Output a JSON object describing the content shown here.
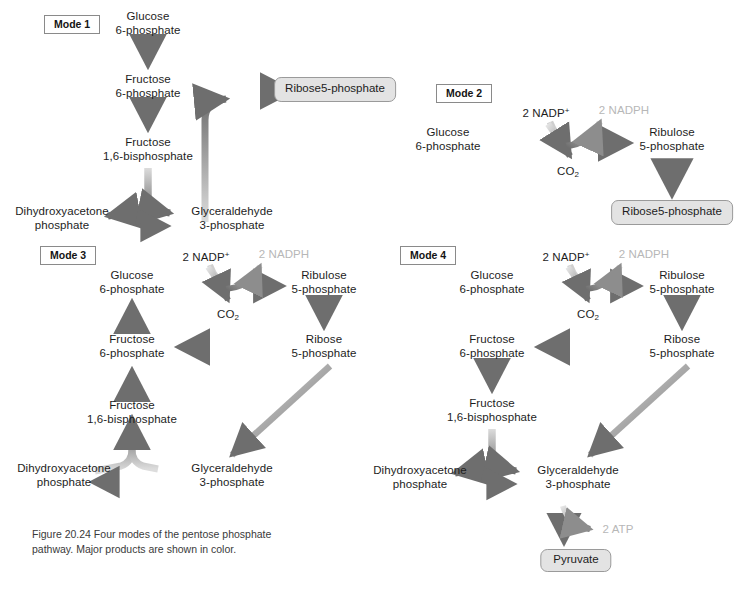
{
  "figure": {
    "caption_line1": "Figure 20.24  Four modes of the pentose",
    "caption_line2": "phosphate pathway.  Major products are",
    "caption_line3": "shown in color."
  },
  "colors": {
    "arrow_dark": "#6e6e6e",
    "arrow_light": "#d8d8d8",
    "product_box_fill": "#e3e3e3",
    "product_box_border": "#9a9a9a",
    "mode_box_border": "#8a8a8a",
    "faint_text": "#b7b7b7",
    "text": "#1d1d1d",
    "background": "#ffffff"
  },
  "modes": [
    {
      "id": "mode1",
      "label": "Mode 1",
      "nodes": [
        {
          "name": "glucose-6-phosphate",
          "line1": "Glucose",
          "line2": "6-phosphate"
        },
        {
          "name": "fructose-6-phosphate",
          "line1": "Fructose",
          "line2": "6-phosphate"
        },
        {
          "name": "fructose-1-6-bisphosphate",
          "line1": "Fructose",
          "line2": "1,6-bisphosphate"
        },
        {
          "name": "dihydroxyacetone-phosphate",
          "line1": "Dihydroxyacetone",
          "line2": "phosphate"
        },
        {
          "name": "glyceraldehyde-3-phosphate",
          "line1": "Glyceraldehyde",
          "line2": "3-phosphate"
        }
      ],
      "product": {
        "name": "ribose-5-phosphate",
        "line1": "Ribose",
        "line2": "5-phosphate"
      }
    },
    {
      "id": "mode2",
      "label": "Mode 2",
      "nodes": [
        {
          "name": "glucose-6-phosphate",
          "line1": "Glucose",
          "line2": "6-phosphate"
        },
        {
          "name": "ribulose-5-phosphate",
          "line1": "Ribulose",
          "line2": "5-phosphate"
        }
      ],
      "cofactor_in": "2 NADP",
      "cofactor_in_sup": "+",
      "cofactor_out": "2 NADPH",
      "byproduct": "CO",
      "byproduct_sub": "2",
      "product": {
        "name": "ribose-5-phosphate",
        "line1": "Ribose",
        "line2": "5-phosphate"
      }
    },
    {
      "id": "mode3",
      "label": "Mode 3",
      "nodes": [
        {
          "name": "glucose-6-phosphate",
          "line1": "Glucose",
          "line2": "6-phosphate"
        },
        {
          "name": "ribulose-5-phosphate",
          "line1": "Ribulose",
          "line2": "5-phosphate"
        },
        {
          "name": "ribose-5-phosphate",
          "line1": "Ribose",
          "line2": "5-phosphate"
        },
        {
          "name": "fructose-6-phosphate",
          "line1": "Fructose",
          "line2": "6-phosphate"
        },
        {
          "name": "fructose-1-6-bisphosphate",
          "line1": "Fructose",
          "line2": "1,6-bisphosphate"
        },
        {
          "name": "dihydroxyacetone-phosphate",
          "line1": "Dihydroxyacetone",
          "line2": "phosphate"
        },
        {
          "name": "glyceraldehyde-3-phosphate",
          "line1": "Glyceraldehyde",
          "line2": "3-phosphate"
        }
      ],
      "cofactor_in": "2 NADP",
      "cofactor_in_sup": "+",
      "cofactor_out": "2 NADPH",
      "byproduct": "CO",
      "byproduct_sub": "2"
    },
    {
      "id": "mode4",
      "label": "Mode 4",
      "nodes": [
        {
          "name": "glucose-6-phosphate",
          "line1": "Glucose",
          "line2": "6-phosphate"
        },
        {
          "name": "ribulose-5-phosphate",
          "line1": "Ribulose",
          "line2": "5-phosphate"
        },
        {
          "name": "ribose-5-phosphate",
          "line1": "Ribose",
          "line2": "5-phosphate"
        },
        {
          "name": "fructose-6-phosphate",
          "line1": "Fructose",
          "line2": "6-phosphate"
        },
        {
          "name": "fructose-1-6-bisphosphate",
          "line1": "Fructose",
          "line2": "1,6-bisphosphate"
        },
        {
          "name": "dihydroxyacetone-phosphate",
          "line1": "Dihydroxyacetone",
          "line2": "phosphate"
        },
        {
          "name": "glyceraldehyde-3-phosphate",
          "line1": "Glyceraldehyde",
          "line2": "3-phosphate"
        }
      ],
      "cofactor_in": "2 NADP",
      "cofactor_in_sup": "+",
      "cofactor_out": "2 NADPH",
      "byproduct": "CO",
      "byproduct_sub": "2",
      "energy_out": "2 ATP",
      "product": {
        "name": "pyruvate",
        "line1": "Pyruvate"
      }
    }
  ]
}
